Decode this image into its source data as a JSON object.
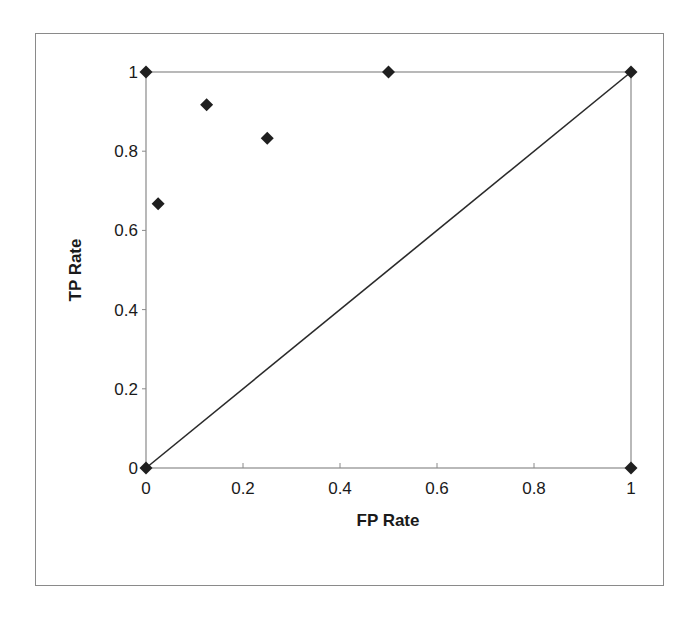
{
  "chart_data": {
    "type": "scatter",
    "title": "",
    "xlabel": "FP Rate",
    "ylabel": "TP Rate",
    "xlim": [
      0,
      1
    ],
    "ylim": [
      0,
      1
    ],
    "x_ticks": [
      "0",
      "0.2",
      "0.4",
      "0.6",
      "0.8",
      "1"
    ],
    "y_ticks": [
      "0",
      "0.2",
      "0.4",
      "0.6",
      "0.8",
      "1"
    ],
    "grid": false,
    "legend": null,
    "series": [
      {
        "name": "ROC points",
        "marker": "diamond",
        "points": [
          {
            "x": 0,
            "y": 0
          },
          {
            "x": 0,
            "y": 1
          },
          {
            "x": 0.025,
            "y": 0.667
          },
          {
            "x": 0.125,
            "y": 0.917
          },
          {
            "x": 0.25,
            "y": 0.833
          },
          {
            "x": 0.5,
            "y": 1
          },
          {
            "x": 1,
            "y": 1
          },
          {
            "x": 1,
            "y": 0
          }
        ]
      },
      {
        "name": "Random classifier diagonal",
        "type": "line",
        "points": [
          {
            "x": 0,
            "y": 0
          },
          {
            "x": 1,
            "y": 1
          }
        ]
      }
    ]
  },
  "colors": {
    "marker": "#1f1f1f",
    "line": "#2a2a2a",
    "plot_border": "#8a8a8a",
    "frame_border": "#8a8a8a"
  }
}
